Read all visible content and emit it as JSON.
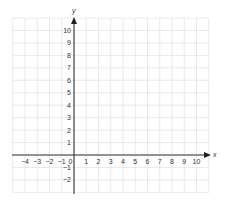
{
  "chart_data": {
    "type": "coordinate-plane",
    "title": "",
    "xlabel": "x",
    "ylabel": "y",
    "xlim": [
      -5,
      11
    ],
    "ylim": [
      -3,
      11
    ],
    "grid": true,
    "x_ticks": [
      "−4",
      "−3",
      "−2",
      "−1",
      "0",
      "1",
      "2",
      "3",
      "4",
      "5",
      "6",
      "7",
      "8",
      "9",
      "10"
    ],
    "x_tick_values": [
      -4,
      -3,
      -2,
      -1,
      0,
      1,
      2,
      3,
      4,
      5,
      6,
      7,
      8,
      9,
      10
    ],
    "y_ticks": [
      "10",
      "9",
      "8",
      "7",
      "6",
      "5",
      "4",
      "3",
      "2",
      "1",
      "−1",
      "−2"
    ],
    "y_tick_values": [
      10,
      9,
      8,
      7,
      6,
      5,
      4,
      3,
      2,
      1,
      -1,
      -2
    ],
    "points": [],
    "colors": {
      "grid": "#e4e4e4",
      "axis": "#333333",
      "text": "#333333"
    }
  }
}
